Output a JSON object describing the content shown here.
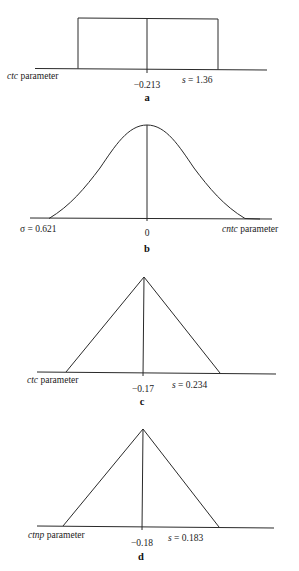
{
  "figure": {
    "panels": [
      {
        "id": "a",
        "letter": "a",
        "shape": "uniform",
        "axis_label_italic": "ctc",
        "axis_label_rest": " parameter",
        "center_label": "−0.213",
        "spread_label_italic": "s",
        "spread_label_rest": " = 1.36"
      },
      {
        "id": "b",
        "letter": "b",
        "shape": "normal",
        "axis_label_italic": "cntc",
        "axis_label_rest": " parameter",
        "center_label": "0",
        "spread_label": "σ = 0.621"
      },
      {
        "id": "c",
        "letter": "c",
        "shape": "triangular",
        "axis_label_italic": "ctc",
        "axis_label_rest": " parameter",
        "center_label": "−0.17",
        "spread_label_italic": "s",
        "spread_label_rest": " = 0.234"
      },
      {
        "id": "d",
        "letter": "d",
        "shape": "triangular",
        "axis_label_italic": "ctnp",
        "axis_label_rest": " parameter",
        "center_label": "−0.18",
        "spread_label_italic": "s",
        "spread_label_rest": " = 0.183"
      }
    ]
  },
  "colors": {
    "line": "#2a2a2a",
    "text": "#222222",
    "background": "#ffffff"
  }
}
